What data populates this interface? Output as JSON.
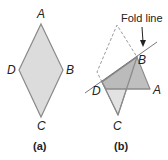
{
  "figure_a": {
    "caption": "(a)",
    "vertices": {
      "A": "A",
      "B": "B",
      "C": "C",
      "D": "D"
    }
  },
  "figure_b": {
    "caption": "(b)",
    "annotation": "Fold line",
    "vertices": {
      "A": "A",
      "B": "B",
      "C": "C",
      "D": "D"
    }
  },
  "colors": {
    "fill_light": "#dcdcdc",
    "fill_dark": "#b4b4b4",
    "stroke": "#8a8a8a",
    "dashed": "#9a9a9a",
    "text": "#222222"
  }
}
